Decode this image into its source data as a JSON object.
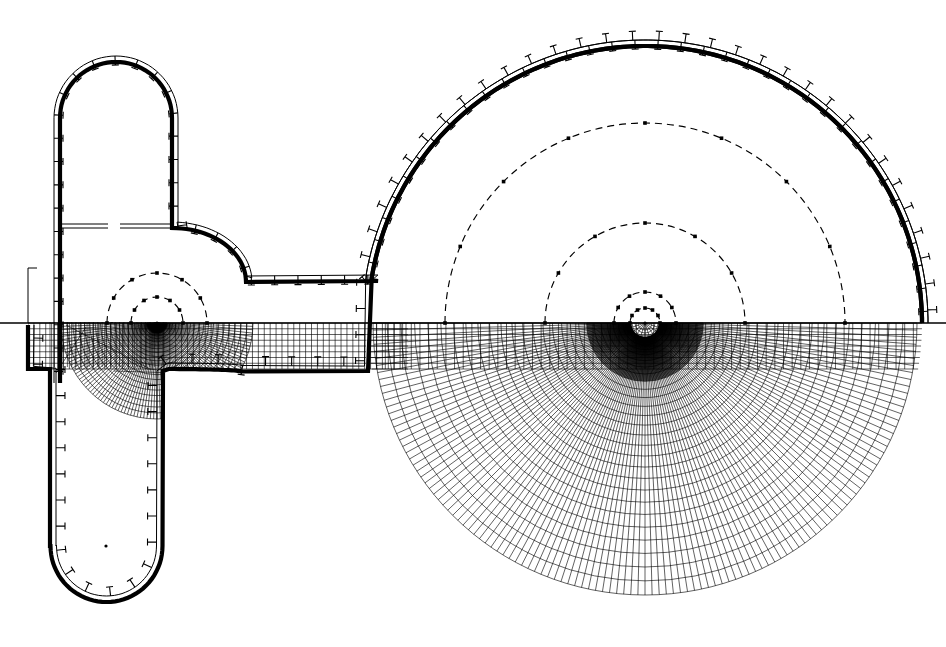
{
  "figure": {
    "kind": "engineering-line-diagram",
    "canvas": {
      "width": 946,
      "height": 647,
      "background": "#ffffff"
    },
    "ink_color": "#000000",
    "symmetry_axis_y": 323,
    "description_upper": "solid boundary outline with outward flange ticks and dashed equipotential semicircles",
    "description_lower": "mirrored boundary filled with curvilinear radial and concentric mesh"
  },
  "centers": [
    {
      "name": "main-chamber-center",
      "x": 645,
      "y": 323,
      "label": ""
    },
    {
      "name": "duct-elbow-center",
      "x": 157,
      "y": 323,
      "label": ""
    },
    {
      "name": "shaft-toe-center",
      "x": 106,
      "y": 546,
      "label": ""
    }
  ],
  "geometry": {
    "main_circle": {
      "cx": 645,
      "cy": 323,
      "r": 277
    },
    "main_circle_inner_offset": 7,
    "duct": {
      "top_y": 281,
      "left_x": 186,
      "right_x": 378,
      "band_top_y": 323,
      "band_bottom_y": 369
    },
    "shaft": {
      "left_x": 60,
      "right_x": 172,
      "crown_cy": 118,
      "crown_r": 56,
      "top_y": 62,
      "slot_y": 228,
      "slot_left_gap": [
        62,
        108
      ],
      "slot_right_gap": [
        120,
        172
      ],
      "stub_x": 28,
      "stub_top_y": 268,
      "stub_bottom_y": 378
    },
    "lower_leg": {
      "left_x": 50,
      "right_x": 163,
      "toe_cy": 546,
      "toe_r": 56,
      "bottom_y": 602
    },
    "fillet": {
      "from_x": 172,
      "from_y": 228,
      "to_x": 245,
      "to_y": 281,
      "r": 74
    },
    "dashed_arc_radii": [
      200,
      100,
      31,
      15
    ],
    "dashed_arc_radii_left": [
      50,
      26
    ],
    "mesh": {
      "radial_lines": 120,
      "concentric_rings": 28,
      "band_columns": 64,
      "band_rows": 8
    }
  },
  "ticks": {
    "count_main_upper": 46,
    "count_main_lower": 46,
    "length": 9,
    "head_width": 7,
    "note": "small T-shaped flange stubs projecting outward from the boundary"
  },
  "legend": {
    "visible": false,
    "items": []
  },
  "annotations": [],
  "chart_data": {
    "type": "line",
    "xlabel": "",
    "ylabel": "",
    "series": [
      {
        "name": "boundary-outline-upper",
        "values": []
      },
      {
        "name": "boundary-outline-lower",
        "values": []
      },
      {
        "name": "equipotential-semicircles",
        "values": [
          200,
          100,
          31,
          15
        ]
      },
      {
        "name": "equipotential-semicircles-left",
        "values": [
          50,
          26
        ]
      }
    ]
  }
}
